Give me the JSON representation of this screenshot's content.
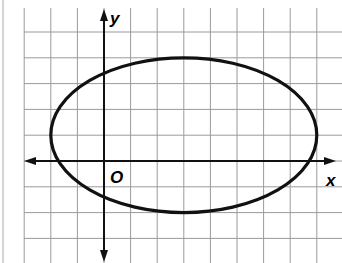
{
  "chart_data": {
    "type": "line",
    "title": "",
    "xlabel": "x",
    "ylabel": "y",
    "origin_label": "O",
    "grid": true,
    "grid_unit": 1,
    "xlim": [
      -3,
      9
    ],
    "ylim": [
      -4,
      6
    ],
    "series": [
      {
        "name": "ellipse",
        "shape": "ellipse",
        "center": [
          3,
          1
        ],
        "semi_axis_x": 5,
        "semi_axis_y": 3,
        "equation": "(x-3)^2/25 + (y-1)^2/9 = 1",
        "vertices": [
          [
            -2,
            1
          ],
          [
            8,
            1
          ]
        ],
        "co_vertices": [
          [
            3,
            4
          ],
          [
            3,
            -2
          ]
        ]
      }
    ]
  },
  "colors": {
    "grid": "#9a9a9a",
    "axis": "#111111",
    "curve": "#111111",
    "background": "#ffffff"
  }
}
